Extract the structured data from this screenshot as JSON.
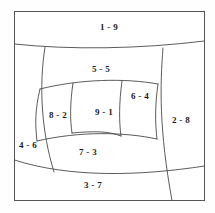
{
  "diagram": {
    "background_color": "#ffffff",
    "line_color": "#4a4a4a",
    "frame_color": "#555555",
    "text_color": "#1c1c1c",
    "regions": [
      {
        "id": "region-1",
        "label": "1 - 9",
        "index": "1",
        "value": "9",
        "cx": 109,
        "cy": 27
      },
      {
        "id": "region-5",
        "label": "5 - 5",
        "index": "5",
        "value": "5",
        "cx": 101,
        "cy": 69
      },
      {
        "id": "region-6",
        "label": "6 - 4",
        "index": "6",
        "value": "4",
        "cx": 140,
        "cy": 96
      },
      {
        "id": "region-8",
        "label": "8 - 2",
        "index": "8",
        "value": "2",
        "cx": 58,
        "cy": 115
      },
      {
        "id": "region-9",
        "label": "9 - 1",
        "index": "9",
        "value": "1",
        "cx": 104,
        "cy": 112
      },
      {
        "id": "region-2",
        "label": "2 - 8",
        "index": "2",
        "value": "8",
        "cx": 181,
        "cy": 120
      },
      {
        "id": "region-4",
        "label": "4 - 6",
        "index": "4",
        "value": "6",
        "cx": 28,
        "cy": 145
      },
      {
        "id": "region-7",
        "label": "7 - 3",
        "index": "7",
        "value": "3",
        "cx": 88,
        "cy": 152
      },
      {
        "id": "region-3",
        "label": "3 - 7",
        "index": "3",
        "value": "7",
        "cx": 93,
        "cy": 185
      }
    ]
  }
}
